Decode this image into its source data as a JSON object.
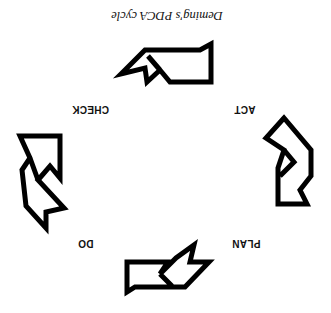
{
  "diagram": {
    "title": "Deming's PDCA cycle",
    "orientation": "rotated 180 degrees",
    "stages": [
      {
        "label": "PLAN"
      },
      {
        "label": "DO"
      },
      {
        "label": "CHECK"
      },
      {
        "label": "ACT"
      }
    ],
    "arrow_count": 4,
    "stroke_color": "#000000",
    "background": "#ffffff"
  }
}
